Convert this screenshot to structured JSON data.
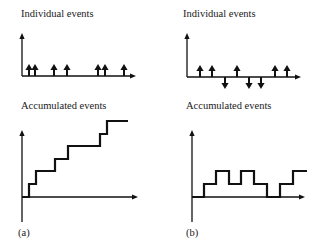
{
  "panels": [
    {
      "id": "a",
      "caption": "(a)",
      "top": {
        "title": "Individual events",
        "axis": {
          "origin": [
            22,
            76
          ],
          "y_top": 33,
          "x_right": 136
        },
        "events": [
          {
            "x": 29,
            "dir": "up"
          },
          {
            "x": 35,
            "dir": "up"
          },
          {
            "x": 54,
            "dir": "up"
          },
          {
            "x": 67,
            "dir": "up"
          },
          {
            "x": 98,
            "dir": "up"
          },
          {
            "x": 105,
            "dir": "up"
          },
          {
            "x": 124,
            "dir": "up"
          }
        ]
      },
      "bottom": {
        "title": "Accumulated events",
        "axis": {
          "origin": [
            22,
            197
          ],
          "y_top": 130,
          "y_bottom": 222,
          "x_right": 138
        },
        "step_points": [
          [
            22,
            197
          ],
          [
            29,
            197
          ],
          [
            29,
            184
          ],
          [
            36,
            184
          ],
          [
            36,
            171
          ],
          [
            55,
            171
          ],
          [
            55,
            159
          ],
          [
            68,
            159
          ],
          [
            68,
            146
          ],
          [
            100,
            146
          ],
          [
            100,
            134
          ],
          [
            107,
            134
          ],
          [
            107,
            121
          ],
          [
            128,
            121
          ]
        ]
      }
    },
    {
      "id": "b",
      "caption": "(b)",
      "top": {
        "title": "Individual events",
        "axis": {
          "origin": [
            187,
            77
          ],
          "y_top": 33,
          "x_right": 301
        },
        "events": [
          {
            "x": 200,
            "dir": "up"
          },
          {
            "x": 212,
            "dir": "up"
          },
          {
            "x": 225,
            "dir": "down"
          },
          {
            "x": 237,
            "dir": "up"
          },
          {
            "x": 249,
            "dir": "down"
          },
          {
            "x": 261,
            "dir": "down"
          },
          {
            "x": 275,
            "dir": "up"
          },
          {
            "x": 287,
            "dir": "up"
          }
        ]
      },
      "bottom": {
        "title": "Accumulated events",
        "axis": {
          "origin": [
            192,
            197
          ],
          "y_top": 130,
          "y_bottom": 222,
          "x_right": 305
        },
        "step_points": [
          [
            192,
            197
          ],
          [
            204,
            197
          ],
          [
            204,
            184
          ],
          [
            216,
            184
          ],
          [
            216,
            171
          ],
          [
            229,
            171
          ],
          [
            229,
            184
          ],
          [
            241,
            184
          ],
          [
            241,
            171
          ],
          [
            254,
            171
          ],
          [
            254,
            184
          ],
          [
            267,
            184
          ],
          [
            267,
            197
          ],
          [
            280,
            197
          ],
          [
            280,
            184
          ],
          [
            293,
            184
          ],
          [
            293,
            171
          ],
          [
            307,
            171
          ]
        ]
      }
    }
  ],
  "colors": {
    "ink": "#111111",
    "background": "#ffffff"
  }
}
